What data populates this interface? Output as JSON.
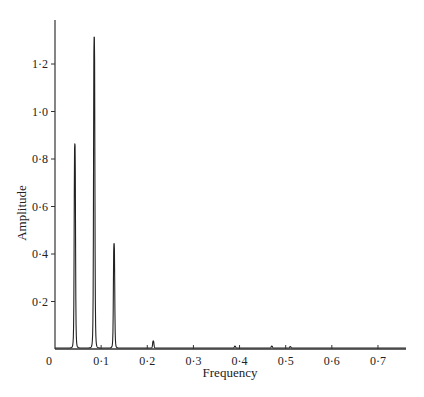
{
  "chart_data": {
    "type": "line",
    "title": "",
    "xlabel": "Frequency",
    "ylabel": "Amplitude",
    "xlim": [
      0,
      0.76
    ],
    "ylim": [
      0,
      1.38
    ],
    "grid": false,
    "legend": null,
    "x_ticks": [
      {
        "value": 0,
        "label": "0"
      },
      {
        "value": 0.1,
        "label": "0·1"
      },
      {
        "value": 0.2,
        "label": "0·2"
      },
      {
        "value": 0.3,
        "label": "0·3"
      },
      {
        "value": 0.4,
        "label": "0·4"
      },
      {
        "value": 0.5,
        "label": "0·5"
      },
      {
        "value": 0.6,
        "label": "0·6"
      },
      {
        "value": 0.7,
        "label": "0·7"
      }
    ],
    "y_ticks": [
      {
        "value": 0.2,
        "label": "0·2"
      },
      {
        "value": 0.4,
        "label": "0·4"
      },
      {
        "value": 0.6,
        "label": "0·6"
      },
      {
        "value": 0.8,
        "label": "0·8"
      },
      {
        "value": 1.0,
        "label": "1·0"
      },
      {
        "value": 1.2,
        "label": "1·2"
      }
    ],
    "series": [
      {
        "name": "Amplitude spectrum",
        "peaks": [
          {
            "frequency": 0.043,
            "amplitude": 0.86
          },
          {
            "frequency": 0.085,
            "amplitude": 1.31
          },
          {
            "frequency": 0.128,
            "amplitude": 0.44
          },
          {
            "frequency": 0.213,
            "amplitude": 0.03
          },
          {
            "frequency": 0.39,
            "amplitude": 0.008
          },
          {
            "frequency": 0.47,
            "amplitude": 0.008
          },
          {
            "frequency": 0.51,
            "amplitude": 0.006
          }
        ]
      }
    ]
  }
}
